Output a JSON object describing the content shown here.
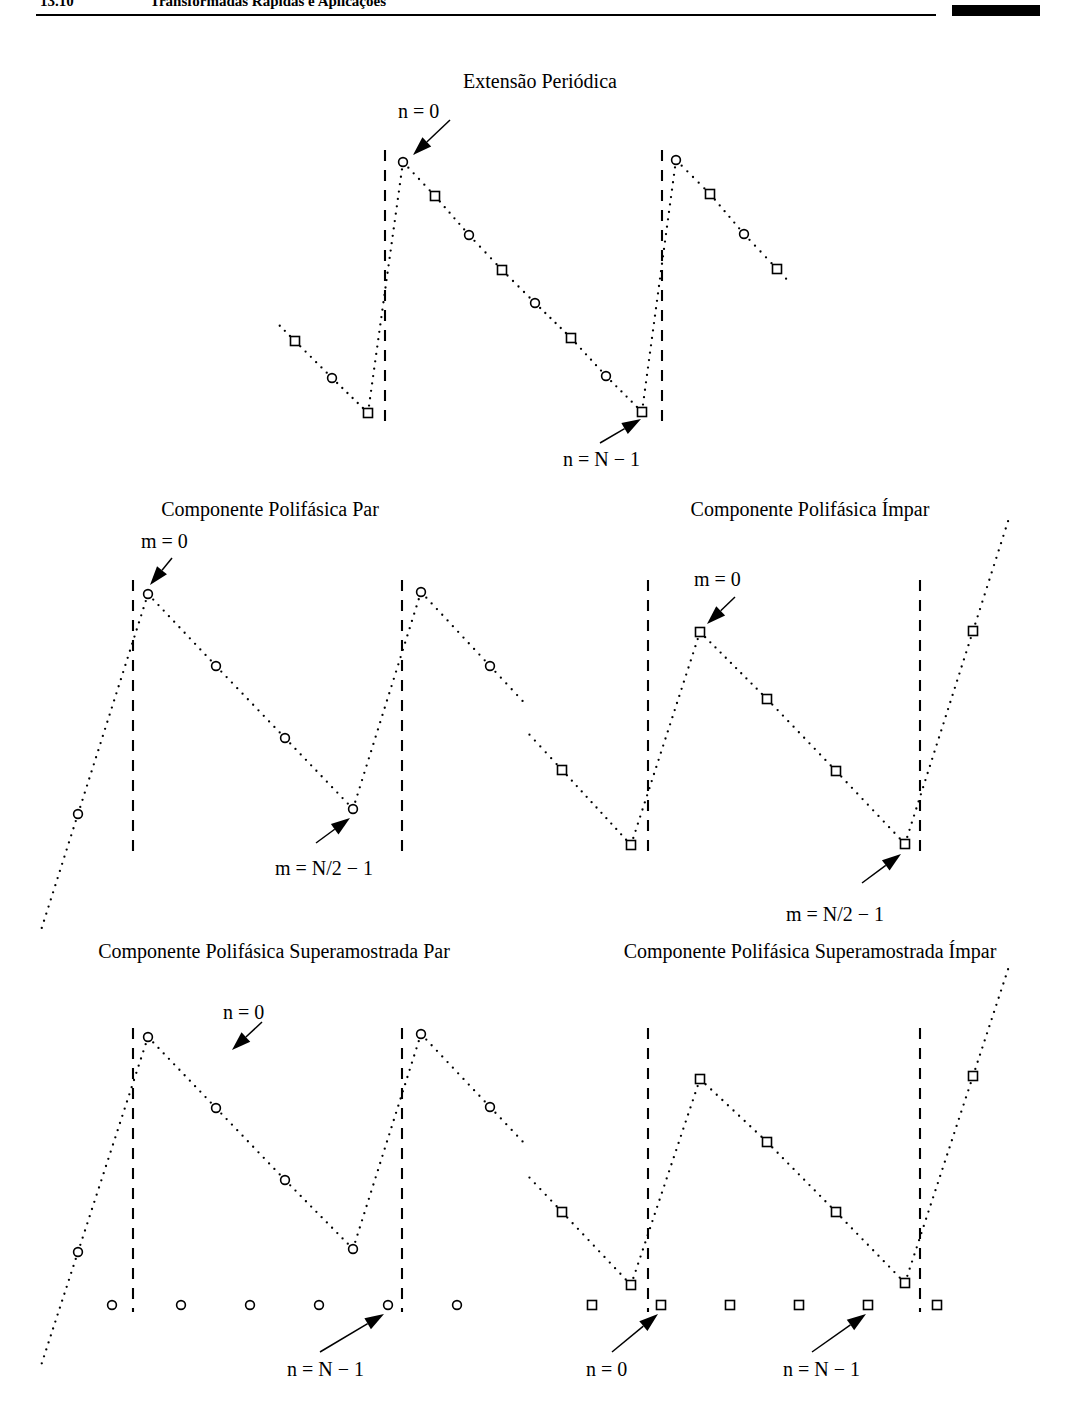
{
  "header": {
    "chapter": "13.10",
    "title": "Transformadas Rápidas e Aplicações",
    "rule_color": "#000000"
  },
  "figure": {
    "caption_style": "serif",
    "marker_colors": {
      "stroke": "#000000",
      "fill": "#ffffff"
    },
    "dotted_color": "#000000",
    "boundary_color": "#000000"
  },
  "panels": [
    {
      "id": "periodic-extension",
      "title": "Extensão Periódica",
      "annotations": [
        {
          "id": "n-zero",
          "text": "n = 0"
        },
        {
          "id": "n-last",
          "text": "n = N − 1"
        }
      ]
    },
    {
      "id": "even-polyphase",
      "title": "Componente Polifásica Par",
      "annotations": [
        {
          "id": "m-zero",
          "text": "m = 0"
        },
        {
          "id": "m-last",
          "text": "m = N/2 − 1"
        }
      ]
    },
    {
      "id": "odd-polyphase",
      "title": "Componente Polifásica Ímpar",
      "annotations": [
        {
          "id": "m-zero",
          "text": "m = 0"
        },
        {
          "id": "m-last",
          "text": "m = N/2 − 1"
        }
      ]
    },
    {
      "id": "even-upsampled",
      "title": "Componente Polifásica Superamostrada Par",
      "annotations": [
        {
          "id": "n-zero",
          "text": "n = 0"
        },
        {
          "id": "n-last",
          "text": "n = N − 1"
        }
      ]
    },
    {
      "id": "odd-upsampled",
      "title": "Componente Polifásica Superamostrada Ímpar",
      "annotations": [
        {
          "id": "n-zero",
          "text": "n = 0"
        },
        {
          "id": "n-last",
          "text": "n = N − 1"
        }
      ]
    }
  ],
  "chart_data": [
    {
      "id": "periodic-extension",
      "type": "scatter",
      "title": "Extensão Periódica",
      "xlabel": "",
      "ylabel": "",
      "grid": false,
      "legend": null,
      "description": "Periodic sawtooth sequence x[n]; circles mark even-index samples, squares mark odd-index samples. Dashed vertical lines delimit one period of N samples.",
      "period_samples": 16,
      "marker_cycle": [
        "circle",
        "square"
      ],
      "boundaries_x": [
        385,
        662
      ],
      "x": [
        295,
        332,
        368,
        403,
        435,
        469,
        502,
        535,
        571,
        606,
        642,
        676,
        710,
        744,
        777
      ],
      "y": [
        341,
        378,
        413,
        162,
        196,
        235,
        270,
        303,
        338,
        376,
        412,
        160,
        194,
        234,
        269
      ],
      "markers": [
        "square",
        "circle",
        "square",
        "circle",
        "square",
        "circle",
        "square",
        "circle",
        "square",
        "circle",
        "square",
        "circle",
        "square",
        "circle",
        "square"
      ],
      "annotations": [
        {
          "text": "n = 0",
          "target_x": 403,
          "target_y": 162
        },
        {
          "text": "n = N − 1",
          "target_x": 642,
          "target_y": 412
        }
      ]
    },
    {
      "id": "even-polyphase",
      "type": "scatter",
      "title": "Componente Polifásica Par",
      "xlabel": "",
      "ylabel": "",
      "grid": false,
      "legend": null,
      "description": "Even polyphase component x[2m]; circles only, spaced twice as far apart. One period spans N/2 samples.",
      "period_samples": 8,
      "marker_cycle": [
        "circle"
      ],
      "boundaries_x": [
        133,
        402
      ],
      "x": [
        78,
        148,
        216,
        285,
        353,
        421,
        490
      ],
      "y": [
        814,
        594,
        666,
        738,
        809,
        592,
        666
      ],
      "markers": [
        "circle",
        "circle",
        "circle",
        "circle",
        "circle",
        "circle",
        "circle"
      ],
      "annotations": [
        {
          "text": "m = 0",
          "target_x": 148,
          "target_y": 594
        },
        {
          "text": "m = N/2 − 1",
          "target_x": 353,
          "target_y": 809
        }
      ]
    },
    {
      "id": "odd-polyphase",
      "type": "scatter",
      "title": "Componente Polifásica Ímpar",
      "xlabel": "",
      "ylabel": "",
      "grid": false,
      "legend": null,
      "description": "Odd polyphase component x[2m+1]; squares only, offset by half a step relative to the even component.",
      "period_samples": 8,
      "marker_cycle": [
        "square"
      ],
      "boundaries_x": [
        648,
        920
      ],
      "x": [
        562,
        631,
        700,
        767,
        836,
        905,
        973
      ],
      "y": [
        770,
        845,
        632,
        699,
        771,
        844,
        631
      ],
      "markers": [
        "square",
        "square",
        "square",
        "square",
        "square",
        "square",
        "square"
      ],
      "annotations": [
        {
          "text": "m = 0",
          "target_x": 700,
          "target_y": 632
        },
        {
          "text": "m = N/2 − 1",
          "target_x": 905,
          "target_y": 844
        }
      ]
    },
    {
      "id": "even-upsampled",
      "type": "scatter",
      "title": "Componente Polifásica Superamostrada Par",
      "xlabel": "",
      "ylabel": "",
      "grid": false,
      "legend": null,
      "description": "Even polyphase component upsampled by 2: nonzero circles at even indices plus inserted zero samples along the baseline.",
      "period_samples": 16,
      "marker_cycle": [
        "circle"
      ],
      "boundaries_x": [
        133,
        402
      ],
      "x": [
        78,
        148,
        216,
        285,
        353,
        421,
        490
      ],
      "y": [
        1252,
        1037,
        1108,
        1180,
        1249,
        1034,
        1107
      ],
      "markers": [
        "circle",
        "circle",
        "circle",
        "circle",
        "circle",
        "circle",
        "circle"
      ],
      "zero_row_y": 1305,
      "zero_row_x": [
        112,
        181,
        250,
        319,
        388,
        457
      ],
      "zero_row_marker": "circle",
      "annotations": [
        {
          "text": "n = 0",
          "target_x": 148,
          "target_y": 1037
        },
        {
          "text": "n = N − 1",
          "target_x": 388,
          "target_y": 1305
        }
      ]
    },
    {
      "id": "odd-upsampled",
      "type": "scatter",
      "title": "Componente Polifásica Superamostrada Ímpar",
      "xlabel": "",
      "ylabel": "",
      "grid": false,
      "legend": null,
      "description": "Odd polyphase component upsampled by 2: nonzero squares at odd indices plus inserted zero samples along the baseline.",
      "period_samples": 16,
      "marker_cycle": [
        "square"
      ],
      "boundaries_x": [
        648,
        920
      ],
      "x": [
        562,
        631,
        700,
        767,
        836,
        905,
        973
      ],
      "y": [
        1212,
        1285,
        1079,
        1142,
        1212,
        1283,
        1076
      ],
      "markers": [
        "square",
        "square",
        "square",
        "square",
        "square",
        "square",
        "square"
      ],
      "zero_row_y": 1305,
      "zero_row_x": [
        592,
        661,
        730,
        799,
        868,
        937
      ],
      "zero_row_marker": "square",
      "annotations": [
        {
          "text": "n = 0",
          "target_x": 661,
          "target_y": 1305
        },
        {
          "text": "n = N − 1",
          "target_x": 868,
          "target_y": 1305
        }
      ]
    }
  ]
}
